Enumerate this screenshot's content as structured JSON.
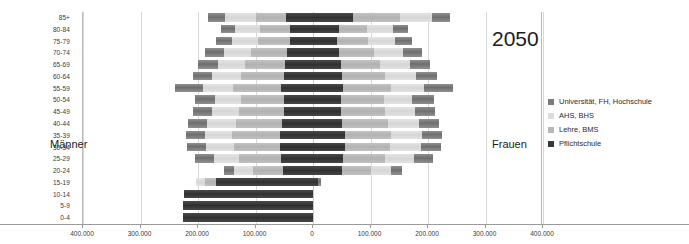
{
  "chart_data": {
    "type": "bar",
    "subtype": "population-pyramid-stacked",
    "title": "",
    "annotations": {
      "year": "2050",
      "left_side": "Männer",
      "right_side": "Frauen"
    },
    "xlabel": "",
    "ylabel": "",
    "grid": true,
    "legend_position": "right",
    "xlim": [
      -400000,
      400000
    ],
    "xticks": [
      -400000,
      -300000,
      -200000,
      -100000,
      0,
      100000,
      200000,
      300000,
      400000
    ],
    "xtick_labels": [
      "400.000",
      "300.000",
      "200.000",
      "100.000",
      "0",
      "100.000",
      "200.000",
      "300.000",
      "400.000"
    ],
    "categories": [
      "85+",
      "80-84",
      "75-79",
      "70-74",
      "65-69",
      "60-64",
      "55-59",
      "50-54",
      "45-49",
      "40-44",
      "35-39",
      "30-34",
      "25-29",
      "20-24",
      "15-19",
      "10-14",
      "5-9",
      "0-4"
    ],
    "series_order": [
      "Universität, FH, Hochschule",
      "AHS, BHS",
      "Lehre, BMS",
      "Pflichtschule"
    ],
    "series_colors": {
      "Universität, FH, Hochschule": "#7b7b7b",
      "AHS, BHS": "#dcdcdc",
      "Lehre, BMS": "#b8b8b8",
      "Pflichtschule": "#383838"
    },
    "men": {
      "Universität, FH, Hochschule": [
        30000,
        25000,
        28000,
        32000,
        34000,
        34000,
        48000,
        35000,
        33000,
        33000,
        33000,
        34000,
        32000,
        17000,
        0,
        0,
        0,
        0
      ],
      "AHS, BHS": [
        54000,
        43000,
        44000,
        47000,
        48000,
        49000,
        53000,
        45000,
        47000,
        50000,
        48000,
        48000,
        45000,
        33000,
        16000,
        0,
        0,
        0
      ],
      "Lehre, BMS": [
        52000,
        52000,
        56000,
        63000,
        70000,
        76000,
        84000,
        75000,
        77000,
        80000,
        82000,
        80000,
        73000,
        53000,
        18000,
        0,
        0,
        0
      ],
      "Pflichtschule": [
        47000,
        40000,
        40000,
        45000,
        48000,
        50000,
        55000,
        51000,
        51000,
        54000,
        58000,
        58000,
        55000,
        52000,
        169000,
        225000,
        226000,
        226000
      ]
    },
    "women": {
      "Pflichtschule": [
        70000,
        46000,
        42000,
        45000,
        48000,
        50000,
        53000,
        49000,
        49000,
        51000,
        55000,
        55000,
        53000,
        50000,
        9000,
        0,
        0,
        0
      ],
      "Lehre, BMS": [
        82000,
        48000,
        53000,
        61000,
        68000,
        75000,
        82000,
        74000,
        76000,
        79000,
        81000,
        79000,
        72000,
        50000,
        0,
        0,
        0,
        0
      ],
      "AHS, BHS": [
        55000,
        45000,
        47000,
        50000,
        52000,
        54000,
        58000,
        50000,
        52000,
        55000,
        53000,
        53000,
        50000,
        36000,
        0,
        0,
        0,
        0
      ],
      "Universität, FH, Hochschule": [
        32000,
        27000,
        30000,
        34000,
        36000,
        36000,
        50000,
        37000,
        35000,
        35000,
        35000,
        36000,
        34000,
        19000,
        5000,
        0,
        0,
        0
      ]
    }
  },
  "legend": {
    "items": [
      {
        "label": "Universität, FH, Hochschule",
        "color": "#7b7b7b"
      },
      {
        "label": "AHS, BHS",
        "color": "#dcdcdc"
      },
      {
        "label": "Lehre, BMS",
        "color": "#b8b8b8"
      },
      {
        "label": "Pflichtschule",
        "color": "#383838"
      }
    ]
  }
}
